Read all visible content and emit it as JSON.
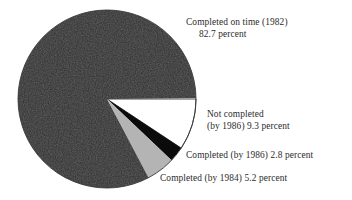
{
  "chart_data": {
    "type": "pie",
    "title": "",
    "unit": "percent",
    "total": 100.0,
    "start_angle_deg": 0,
    "direction": "clockwise",
    "legend": "callout-labels",
    "grid": false,
    "categories": [
      "Completed on time (1982)",
      "Not completed (by 1986)",
      "Completed (by 1986)",
      "Completed (by 1984)"
    ],
    "values": [
      82.7,
      9.3,
      2.8,
      5.2
    ],
    "colors": [
      "#2e2e2e",
      "#ffffff",
      "#0b0b0b",
      "#b4b4b4"
    ],
    "slices": [
      {
        "name": "Completed on time (1982)",
        "value": 82.7,
        "value_text": "82.7 percent",
        "color": "#2e2e2e",
        "start_deg": 61.56,
        "sweep_deg": 297.72
      },
      {
        "name": "Not completed (by 1986)",
        "value": 9.3,
        "value_text": "9.3 percent",
        "color": "#ffffff",
        "start_deg": 0,
        "sweep_deg": 33.48
      },
      {
        "name": "Completed (by 1986)",
        "value": 2.8,
        "value_text": "2.8 percent",
        "color": "#0b0b0b",
        "start_deg": 33.48,
        "sweep_deg": 10.08
      },
      {
        "name": "Completed (by 1984)",
        "value": 5.2,
        "value_text": "5.2 percent",
        "color": "#b4b4b4",
        "start_deg": 43.56,
        "sweep_deg": 18.72
      }
    ]
  },
  "labels": {
    "on_time": {
      "line1": "Completed on time (1982)",
      "line2": "82.7 percent"
    },
    "not_completed": {
      "line1": "Not completed",
      "line2": "(by 1986) 9.3 percent"
    },
    "completed_1986": {
      "line1": "Completed (by 1986) 2.8 percent"
    },
    "completed_1984": {
      "line1": "Completed (by 1984) 5.2 percent"
    }
  },
  "figure": {
    "center_x": 107,
    "center_y": 99,
    "radius": 89,
    "outline_color": "#3a3a3a",
    "background": "#ffffff"
  }
}
